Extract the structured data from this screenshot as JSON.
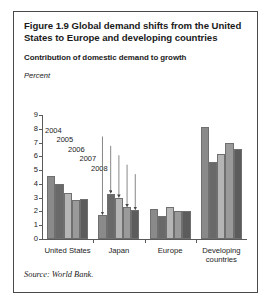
{
  "figure": {
    "title": "Figure 1.9  Global demand shifts from the United States to Europe and developing countries",
    "subtitle": "Contribution of domestic demand to growth",
    "source": "Source: World Bank."
  },
  "chart_data": {
    "type": "bar",
    "title": "Figure 1.9  Global demand shifts from the United States to Europe and developing countries",
    "subtitle": "Contribution of domestic demand to growth",
    "xlabel": "",
    "ylabel": "Percent",
    "ylim": [
      0,
      9
    ],
    "yticks": [
      0,
      1,
      2,
      3,
      4,
      5,
      6,
      7,
      8,
      9
    ],
    "ytick_labels": [
      "0",
      "1",
      "2",
      "3",
      "4",
      "5",
      "6",
      "7",
      "8",
      "9"
    ],
    "grid": false,
    "legend": "none",
    "categories": [
      "United States",
      "Japan",
      "Europe",
      "Developing countries"
    ],
    "series": [
      {
        "name": "2004",
        "color": "#8a8a8a",
        "values": [
          4.6,
          1.75,
          2.15,
          8.15
        ]
      },
      {
        "name": "2005",
        "color": "#696969",
        "values": [
          4.0,
          3.3,
          1.7,
          5.6
        ]
      },
      {
        "name": "2006",
        "color": "#b5b5b5",
        "values": [
          3.35,
          3.0,
          2.35,
          6.2
        ]
      },
      {
        "name": "2007",
        "color": "#9a9a9a",
        "values": [
          2.8,
          2.3,
          2.05,
          7.0
        ]
      },
      {
        "name": "2008",
        "color": "#5c5c5c",
        "values": [
          2.9,
          2.1,
          2.05,
          6.55
        ]
      }
    ],
    "annotations": [
      {
        "label": "2004",
        "series": "2004",
        "category": "Japan"
      },
      {
        "label": "2005",
        "series": "2005",
        "category": "Japan"
      },
      {
        "label": "2006",
        "series": "2006",
        "category": "Japan"
      },
      {
        "label": "2007",
        "series": "2007",
        "category": "Japan"
      },
      {
        "label": "2008",
        "series": "2008",
        "category": "Japan"
      }
    ]
  }
}
